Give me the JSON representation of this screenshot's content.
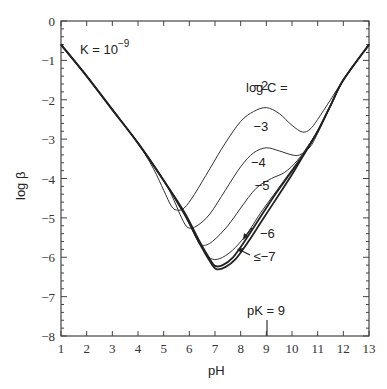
{
  "chart_data": {
    "type": "line",
    "title": "",
    "xlabel": "pH",
    "ylabel": "log β",
    "xlim": [
      1,
      13
    ],
    "ylim": [
      -8,
      0
    ],
    "x_ticks": [
      1,
      2,
      3,
      4,
      5,
      6,
      7,
      8,
      9,
      10,
      11,
      12,
      13
    ],
    "y_ticks": [
      0,
      -1,
      -2,
      -3,
      -4,
      -5,
      -6,
      -7,
      -8
    ],
    "grid": false,
    "annotations": {
      "k_label": "K = 10",
      "k_exp": "−9",
      "legend_header": "log C =",
      "pk_label": "pK = 9",
      "pk_x": 9
    },
    "series": [
      {
        "name": "-2",
        "label": "−2",
        "thick": false,
        "points": [
          [
            1,
            -0.6
          ],
          [
            2,
            -1.4
          ],
          [
            3,
            -2.25
          ],
          [
            4,
            -3.1
          ],
          [
            4.6,
            -3.75
          ],
          [
            5,
            -4.3
          ],
          [
            5.3,
            -4.7
          ],
          [
            5.5,
            -4.8
          ],
          [
            5.8,
            -4.75
          ],
          [
            6.2,
            -4.4
          ],
          [
            6.8,
            -3.75
          ],
          [
            7.4,
            -3.1
          ],
          [
            8,
            -2.55
          ],
          [
            8.5,
            -2.3
          ],
          [
            9,
            -2.2
          ],
          [
            9.5,
            -2.35
          ],
          [
            10,
            -2.65
          ],
          [
            10.4,
            -2.82
          ],
          [
            10.7,
            -2.75
          ],
          [
            11,
            -2.5
          ],
          [
            11.5,
            -2.0
          ],
          [
            12,
            -1.5
          ],
          [
            13,
            -0.6
          ]
        ]
      },
      {
        "name": "-3",
        "label": "−3",
        "thick": false,
        "points": [
          [
            1,
            -0.6
          ],
          [
            2,
            -1.4
          ],
          [
            3,
            -2.25
          ],
          [
            4,
            -3.1
          ],
          [
            5,
            -4.05
          ],
          [
            5.4,
            -4.55
          ],
          [
            5.7,
            -5.0
          ],
          [
            5.95,
            -5.25
          ],
          [
            6.3,
            -5.2
          ],
          [
            6.8,
            -4.9
          ],
          [
            7.4,
            -4.3
          ],
          [
            8,
            -3.7
          ],
          [
            8.5,
            -3.35
          ],
          [
            9,
            -3.22
          ],
          [
            9.5,
            -3.3
          ],
          [
            10,
            -3.4
          ],
          [
            10.3,
            -3.4
          ],
          [
            10.7,
            -3.2
          ],
          [
            11,
            -2.85
          ],
          [
            11.5,
            -2.15
          ],
          [
            12,
            -1.5
          ],
          [
            13,
            -0.6
          ]
        ]
      },
      {
        "name": "-4",
        "label": "−4",
        "thick": false,
        "points": [
          [
            1,
            -0.6
          ],
          [
            2,
            -1.4
          ],
          [
            3,
            -2.25
          ],
          [
            4,
            -3.1
          ],
          [
            5,
            -4.05
          ],
          [
            5.6,
            -4.65
          ],
          [
            6,
            -5.15
          ],
          [
            6.3,
            -5.55
          ],
          [
            6.5,
            -5.7
          ],
          [
            6.9,
            -5.6
          ],
          [
            7.5,
            -5.2
          ],
          [
            8,
            -4.75
          ],
          [
            8.6,
            -4.25
          ],
          [
            9.2,
            -4.0
          ],
          [
            9.7,
            -3.85
          ],
          [
            10.2,
            -3.55
          ],
          [
            10.7,
            -3.1
          ],
          [
            11,
            -2.8
          ],
          [
            11.5,
            -2.15
          ],
          [
            12,
            -1.5
          ],
          [
            13,
            -0.6
          ]
        ]
      },
      {
        "name": "-5",
        "label": "−5",
        "thick": false,
        "points": [
          [
            1,
            -0.6
          ],
          [
            2,
            -1.4
          ],
          [
            3,
            -2.25
          ],
          [
            4,
            -3.1
          ],
          [
            5,
            -4.05
          ],
          [
            5.7,
            -4.75
          ],
          [
            6.2,
            -5.35
          ],
          [
            6.6,
            -5.85
          ],
          [
            6.9,
            -6.05
          ],
          [
            7.3,
            -6.0
          ],
          [
            7.8,
            -5.75
          ],
          [
            8.3,
            -5.35
          ],
          [
            8.8,
            -4.85
          ],
          [
            9.3,
            -4.4
          ],
          [
            9.8,
            -3.95
          ],
          [
            10.3,
            -3.5
          ],
          [
            11,
            -2.8
          ],
          [
            11.5,
            -2.15
          ],
          [
            12,
            -1.5
          ],
          [
            13,
            -0.6
          ]
        ]
      },
      {
        "name": "-6",
        "label": "−6",
        "thick": true,
        "points": [
          [
            1,
            -0.6
          ],
          [
            2,
            -1.4
          ],
          [
            3,
            -2.25
          ],
          [
            4,
            -3.1
          ],
          [
            5,
            -4.05
          ],
          [
            5.8,
            -4.85
          ],
          [
            6.4,
            -5.6
          ],
          [
            6.8,
            -6.05
          ],
          [
            7.0,
            -6.22
          ],
          [
            7.3,
            -6.2
          ],
          [
            7.7,
            -6.0
          ],
          [
            8.2,
            -5.55
          ],
          [
            8.7,
            -5.05
          ],
          [
            9.3,
            -4.45
          ],
          [
            9.9,
            -3.9
          ],
          [
            10.5,
            -3.35
          ],
          [
            11,
            -2.8
          ],
          [
            11.5,
            -2.15
          ],
          [
            12,
            -1.5
          ],
          [
            13,
            -0.6
          ]
        ]
      },
      {
        "name": "<=-7",
        "label": "≤−7",
        "thick": true,
        "points": [
          [
            1,
            -0.6
          ],
          [
            2,
            -1.4
          ],
          [
            3,
            -2.25
          ],
          [
            4,
            -3.1
          ],
          [
            5,
            -4.05
          ],
          [
            5.8,
            -4.9
          ],
          [
            6.4,
            -5.65
          ],
          [
            6.8,
            -6.1
          ],
          [
            7.05,
            -6.3
          ],
          [
            7.4,
            -6.25
          ],
          [
            7.8,
            -6.05
          ],
          [
            8.3,
            -5.6
          ],
          [
            8.8,
            -5.1
          ],
          [
            9.4,
            -4.5
          ],
          [
            10,
            -3.9
          ],
          [
            10.5,
            -3.35
          ],
          [
            11,
            -2.8
          ],
          [
            11.5,
            -2.15
          ],
          [
            12,
            -1.5
          ],
          [
            13,
            -0.6
          ]
        ]
      }
    ],
    "series_label_positions": [
      {
        "label": "−2",
        "pH": 8.5,
        "logb": -1.75
      },
      {
        "label": "−3",
        "pH": 8.5,
        "logb": -2.8
      },
      {
        "label": "−4",
        "pH": 8.4,
        "logb": -3.7
      },
      {
        "label": "−5",
        "pH": 8.55,
        "logb": -4.3
      },
      {
        "label": "−6",
        "pH": 8.75,
        "logb": -5.5
      },
      {
        "label": "≤−7",
        "pH": 8.5,
        "logb": -6.1
      }
    ]
  }
}
